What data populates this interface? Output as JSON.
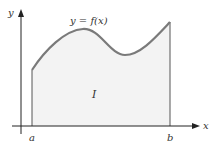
{
  "diagram": {
    "curve_label": "y = f(x)",
    "area_label": "I",
    "x_axis_label": "x",
    "y_axis_label": "y",
    "lower_bound_label": "a",
    "upper_bound_label": "b"
  },
  "colors": {
    "curve": "#7a7a7a",
    "fill": "#f3f3f3",
    "axis": "#222222"
  }
}
